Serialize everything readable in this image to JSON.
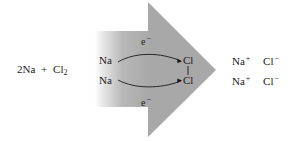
{
  "diagram": {
    "colors": {
      "arrow_fill": "#a8a8a8",
      "arrow_fade_start": "#ffffff",
      "text": "#1a1a1a",
      "background": "#ffffff"
    },
    "reactants": {
      "coefficient": "2Na",
      "plus": "+",
      "cl_symbol": "Cl",
      "cl_subscript": "2"
    },
    "transfer": {
      "na_top": "Na",
      "na_bottom": "Na",
      "cl_top": "Cl",
      "cl_bottom": "Cl",
      "electron_top": {
        "symbol": "e",
        "charge": "−"
      },
      "electron_bottom": {
        "symbol": "e",
        "charge": "−"
      }
    },
    "products": {
      "row1": {
        "cation": "Na",
        "cation_charge": "+",
        "anion": "Cl",
        "anion_charge": "−"
      },
      "row2": {
        "cation": "Na",
        "cation_charge": "+",
        "anion": "Cl",
        "anion_charge": "−"
      }
    }
  }
}
